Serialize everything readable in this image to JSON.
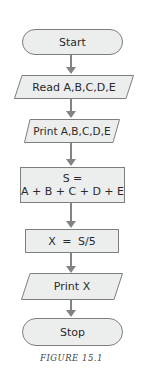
{
  "flowchart": {
    "nodes": [
      {
        "id": "start",
        "type": "terminator",
        "label": "Start"
      },
      {
        "id": "read",
        "type": "input",
        "label": "Read A,B,C,D,E"
      },
      {
        "id": "print_inputs",
        "type": "output",
        "label": "Print A,B,C,D,E"
      },
      {
        "id": "sum",
        "type": "process",
        "label_line1": "S =",
        "label_line2": "A + B + C + D + E"
      },
      {
        "id": "avg",
        "type": "process",
        "label": "X = S/5"
      },
      {
        "id": "print_x",
        "type": "output",
        "label": "Print X"
      },
      {
        "id": "stop",
        "type": "terminator",
        "label": "Stop"
      }
    ],
    "edges": [
      [
        "start",
        "read"
      ],
      [
        "read",
        "print_inputs"
      ],
      [
        "print_inputs",
        "sum"
      ],
      [
        "sum",
        "avg"
      ],
      [
        "avg",
        "print_x"
      ],
      [
        "print_x",
        "stop"
      ]
    ]
  },
  "caption": "FIGURE 15.1",
  "colors": {
    "fill": "#eceeee",
    "stroke": "#7c7f80",
    "arrow": "#808485",
    "text": "#2a2a2a"
  }
}
